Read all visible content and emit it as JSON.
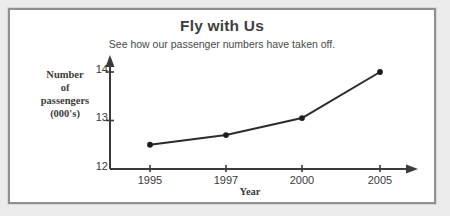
{
  "poster": {
    "title": "Fly with Us",
    "subtitle": "See how our passenger numbers have taken off."
  },
  "axis_labels": {
    "y_line1": "Number",
    "y_line2": "of",
    "y_line3": "passengers",
    "y_line4": "(000's)",
    "x_title": "Year"
  },
  "ticks": {
    "y": [
      "12",
      "13",
      "14"
    ],
    "x": [
      "1995",
      "1997",
      "2000",
      "2005"
    ]
  },
  "colors": {
    "page_background": "#ececec",
    "panel_background": "#ffffff",
    "panel_border": "#8f9093",
    "axis": "#3b3b3b",
    "line": "#2b2b2b",
    "marker": "#1d1d1d",
    "title_text": "#3f3f3f",
    "tick_text": "#3a3a3a"
  },
  "chart_data": {
    "type": "line",
    "title": "Fly with Us",
    "subtitle": "See how our passenger numbers have taken off.",
    "xlabel": "Year",
    "ylabel": "Number of passengers (000's)",
    "x": [
      "1995",
      "1997",
      "2000",
      "2005"
    ],
    "values": [
      12.5,
      12.7,
      13.05,
      14.0
    ],
    "ylim": [
      12,
      14.2
    ],
    "yticks": [
      12,
      13,
      14
    ],
    "grid": false,
    "legend": false,
    "markers": "filled-circle",
    "axis_arrows": [
      "y-top",
      "x-right"
    ]
  }
}
